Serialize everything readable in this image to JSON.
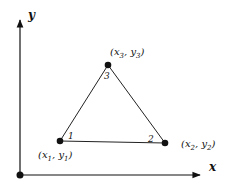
{
  "axes": {
    "x_label": "x",
    "y_label": "y",
    "origin": {
      "cx": 20,
      "cy": 175
    },
    "x_end": 201,
    "y_end": 18
  },
  "triangle": {
    "stroke": "#222222",
    "vertices": [
      {
        "id": "1",
        "cx": 60,
        "cy": 141,
        "coord_label": "(x1, y1)",
        "x_sym": "x",
        "x_sub": "1",
        "y_sym": "y",
        "y_sub": "1"
      },
      {
        "id": "2",
        "cx": 165,
        "cy": 143,
        "coord_label": "(x2, y2)",
        "x_sym": "x",
        "x_sub": "2",
        "y_sym": "y",
        "y_sub": "2"
      },
      {
        "id": "3",
        "cx": 108,
        "cy": 65,
        "coord_label": "(x3, y3)",
        "x_sym": "x",
        "x_sub": "3",
        "y_sym": "y",
        "y_sub": "3"
      }
    ]
  },
  "colors": {
    "ink": "#111111",
    "background": "#ffffff"
  }
}
